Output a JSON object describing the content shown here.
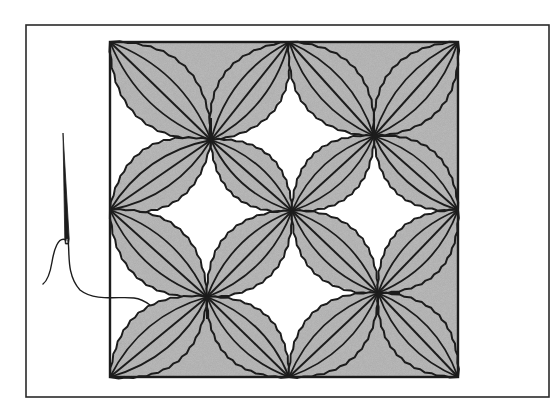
{
  "figure": {
    "title": "Quilt block with curved petal appliqué and needle"
  },
  "colors": {
    "background": "#ffffff",
    "ink": "#1c1c1c",
    "fill": "#bdbdbd",
    "frame": "#2a2a2a"
  },
  "geometry": {
    "outer_frame": {
      "x": 26,
      "y": 25,
      "w": 523,
      "h": 372
    },
    "block": {
      "x": 110,
      "y": 42,
      "w": 348,
      "h": 335
    },
    "nodes": {
      "TL": [
        110,
        42
      ],
      "T": [
        289,
        42
      ],
      "TR": [
        458,
        42
      ],
      "L": [
        110,
        210
      ],
      "C": [
        292,
        211
      ],
      "R": [
        458,
        210
      ],
      "BL": [
        110,
        377
      ],
      "B": [
        289,
        377
      ],
      "BR": [
        458,
        377
      ],
      "P1": [
        211,
        140
      ],
      "P2": [
        374,
        136
      ],
      "P3": [
        207,
        297
      ],
      "P4": [
        378,
        293
      ]
    },
    "shaded_triangles": [
      [
        "TL",
        "T",
        "P1"
      ],
      [
        "T",
        "TR",
        "P2"
      ],
      [
        "TR",
        "R",
        "P2"
      ],
      [
        "R",
        "BR",
        "P4"
      ],
      [
        "BL",
        "B",
        "P3"
      ],
      [
        "B",
        "BR",
        "P4"
      ]
    ],
    "petals": [
      [
        "P1",
        "TL"
      ],
      [
        "P1",
        "T"
      ],
      [
        "P1",
        "L"
      ],
      [
        "P1",
        "C"
      ],
      [
        "P2",
        "T"
      ],
      [
        "P2",
        "TR"
      ],
      [
        "P2",
        "R"
      ],
      [
        "P2",
        "C"
      ],
      [
        "P3",
        "L"
      ],
      [
        "P3",
        "C"
      ],
      [
        "P3",
        "BL"
      ],
      [
        "P3",
        "B"
      ],
      [
        "P4",
        "C"
      ],
      [
        "P4",
        "R"
      ],
      [
        "P4",
        "B"
      ],
      [
        "P4",
        "BR"
      ]
    ],
    "cross_ticks": [
      {
        "at": "P1",
        "dirs": [
          "up"
        ]
      },
      {
        "at": "P2",
        "dirs": [
          "up",
          "right"
        ]
      },
      {
        "at": "P3",
        "dirs": [
          "down"
        ]
      },
      {
        "at": "P4",
        "dirs": [
          "right",
          "down"
        ]
      }
    ],
    "needle": {
      "tip": [
        63,
        133
      ],
      "eye": [
        67,
        243
      ]
    },
    "thread": {
      "left_tail": "M66,240 C58,236 54,250 52,262 C50,274 47,281 43,284",
      "right_strand": "M68,240 C70,252 66,275 80,290 C95,302 120,296 134,298 C142,299 146,302 150,305"
    }
  }
}
